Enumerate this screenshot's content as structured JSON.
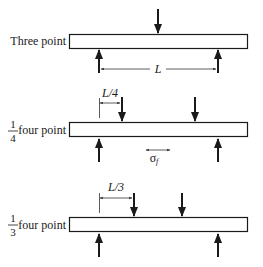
{
  "diagram": {
    "configs": [
      {
        "id": "three-point",
        "label": "Three point",
        "span_label": "L"
      },
      {
        "id": "quarter-four-point",
        "label_fraction_num": "1",
        "label_fraction_den": "4",
        "label": "four point",
        "offset_label": "L/4",
        "stress_label": "σ",
        "stress_subscript": "f"
      },
      {
        "id": "third-four-point",
        "label_fraction_num": "1",
        "label_fraction_den": "3",
        "label": "four point",
        "offset_label": "L/3"
      }
    ],
    "colors": {
      "stroke": "#1a1a1a",
      "dimension": "#333333",
      "background": "#ffffff"
    }
  }
}
